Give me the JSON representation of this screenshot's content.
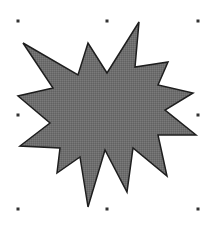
{
  "canvas": {
    "width": 220,
    "height": 240,
    "background": "#ffffff"
  },
  "shape": {
    "type": "explosion-star",
    "fill": "#6e6e6e",
    "stroke": "#1e1e1e",
    "stroke_width": 1.5,
    "points": "23,43 78,75 88,43 107,73 139,22 135,67 168,62 158,85 193,93 165,110 196,135 158,135 167,176 133,148 127,192 105,150 88,207 80,157 57,173 60,148 20,146 50,123 18,96 53,88"
  },
  "selection_handles": {
    "color": "#333333",
    "size": 3,
    "positions": [
      {
        "name": "handle-top-left",
        "x": 18,
        "y": 21
      },
      {
        "name": "handle-top-center",
        "x": 107,
        "y": 21
      },
      {
        "name": "handle-top-right",
        "x": 198,
        "y": 21
      },
      {
        "name": "handle-middle-left",
        "x": 18,
        "y": 115
      },
      {
        "name": "handle-middle-right",
        "x": 198,
        "y": 115
      },
      {
        "name": "handle-bottom-left",
        "x": 18,
        "y": 209
      },
      {
        "name": "handle-bottom-center",
        "x": 107,
        "y": 209
      },
      {
        "name": "handle-bottom-right",
        "x": 198,
        "y": 209
      }
    ]
  }
}
